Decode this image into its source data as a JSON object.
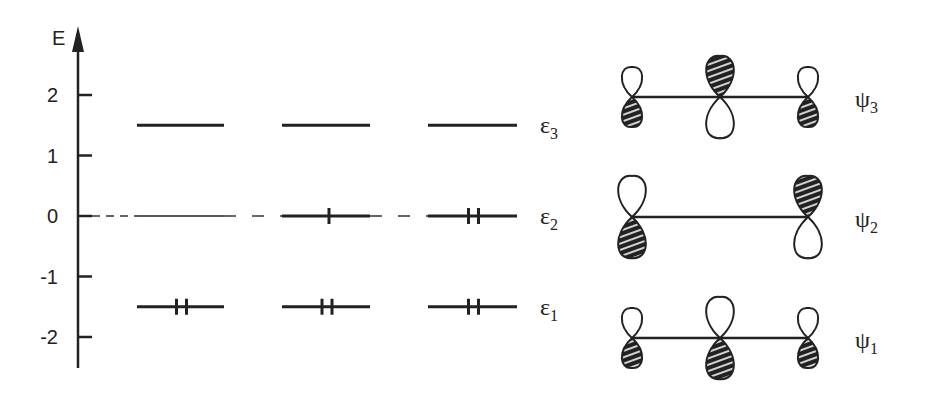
{
  "axis": {
    "label": "E",
    "ticks": [
      {
        "value": 2,
        "label": "2"
      },
      {
        "value": 1,
        "label": "1"
      },
      {
        "value": 0,
        "label": "0"
      },
      {
        "value": -1,
        "label": "-1"
      },
      {
        "value": -2,
        "label": "-2"
      }
    ],
    "range": [
      -2.5,
      3.0
    ]
  },
  "levels": [
    {
      "name": "epsilon3",
      "symbol": "ε",
      "sub": "3",
      "energy": 1.5
    },
    {
      "name": "epsilon2",
      "symbol": "ε",
      "sub": "2",
      "energy": 0.0
    },
    {
      "name": "epsilon1",
      "symbol": "ε",
      "sub": "1",
      "energy": -1.5
    }
  ],
  "columns": [
    {
      "name": "cation",
      "occupancy": {
        "epsilon3": 0,
        "epsilon2": 0,
        "epsilon1": 2
      },
      "epsilon2_empty": true
    },
    {
      "name": "radical",
      "occupancy": {
        "epsilon3": 0,
        "epsilon2": 1,
        "epsilon1": 2
      },
      "epsilon2_empty": false
    },
    {
      "name": "anion",
      "occupancy": {
        "epsilon3": 0,
        "epsilon2": 2,
        "epsilon1": 2
      },
      "epsilon2_empty": false
    }
  ],
  "orbitals": [
    {
      "name": "psi3",
      "symbol": "ψ",
      "sub": "3",
      "atoms": [
        {
          "size": "small",
          "top": "open",
          "bottom": "hatched"
        },
        {
          "size": "large",
          "top": "hatched",
          "bottom": "open"
        },
        {
          "size": "small",
          "top": "open",
          "bottom": "hatched"
        }
      ]
    },
    {
      "name": "psi2",
      "symbol": "ψ",
      "sub": "2",
      "atoms": [
        {
          "size": "large",
          "top": "open",
          "bottom": "hatched"
        },
        {
          "size": "none",
          "top": "none",
          "bottom": "none"
        },
        {
          "size": "large",
          "top": "hatched",
          "bottom": "open"
        }
      ]
    },
    {
      "name": "psi1",
      "symbol": "ψ",
      "sub": "1",
      "atoms": [
        {
          "size": "small",
          "top": "open",
          "bottom": "hatched"
        },
        {
          "size": "large",
          "top": "open",
          "bottom": "hatched"
        },
        {
          "size": "small",
          "top": "open",
          "bottom": "hatched"
        }
      ]
    }
  ]
}
